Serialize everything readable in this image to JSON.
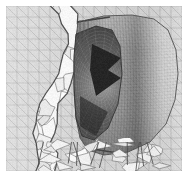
{
  "figure": {
    "title": "Unstructured finite-element mesh of a cut-away axisymmetric body",
    "domain_kind": "scientific-mesh-visualization",
    "render_style": "grayscale wireframe mesh, no axes, no legend, no labels",
    "width_px": 188,
    "height_px": 177,
    "background_color": "#ffffff",
    "margin_px": 6,
    "visible_text": [],
    "palette": {
      "paper_white": "#ffffff",
      "background_mesh_fill": "#d9d9d9",
      "background_mesh_line": "#9a9a9a",
      "body_light": "#efefef",
      "body_mid": "#b4b4b4",
      "body_dark": "#6e6e6e",
      "body_shadow": "#3c3c3c",
      "crack_bright": "#fbfbfb",
      "crack_edge": "#5a5a5a",
      "deep_shadow": "#1c1c1c",
      "outline": "#4a4a4a"
    },
    "components": [
      {
        "name": "background-triangular-mesh",
        "description": "Regular triangulated planar background grid filling the left band and right band of the frame",
        "fill": "#d9d9d9",
        "line": "#9a9a9a",
        "cell_size_px": 11,
        "line_width": 0.45
      },
      {
        "name": "fracture-band",
        "description": "Bright jagged polygonal crack / fragmented region running vertically down the left-center",
        "fill": "#fbfbfb",
        "line": "#5a5a5a",
        "x_center_px": 60,
        "width_px": 34
      },
      {
        "name": "cylindrical-body",
        "description": "Cut-away cylinder / nose-cone rendered with fine stippled triangular surface mesh and banded shading",
        "fill_light": "#e2e2e2",
        "fill_mid": "#a8a8a8",
        "fill_dark": "#707070",
        "axis_angle_deg": -6,
        "cell_size_px": 3.2
      },
      {
        "name": "interior-cavity",
        "description": "Dark hollow interior of the cut body showing an inner conical surface and a sharp wedge shadow",
        "fill": "#5c5c5c",
        "wedge_fill": "#1c1c1c"
      },
      {
        "name": "lower-splinter-region",
        "description": "Bright fragmented shards along the bottom edge under the body",
        "fill": "#f4f4f4",
        "line": "#555555"
      }
    ]
  }
}
